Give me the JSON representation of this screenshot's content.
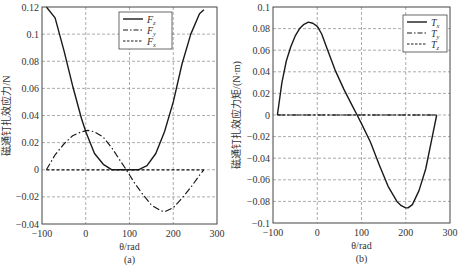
{
  "chart_data": [
    {
      "type": "line",
      "panel_label": "(a)",
      "xlabel": "θ/rad",
      "ylabel": "磁通钉扎效应力/N",
      "xlim": [
        -100,
        300
      ],
      "ylim": [
        -0.04,
        0.12
      ],
      "xticks": [
        "−100",
        "0",
        "100",
        "200",
        "300"
      ],
      "yticks": [
        "0.12",
        "0.1",
        "0.08",
        "0.06",
        "0.04",
        "0.02",
        "0",
        "−0.02",
        "−0.04"
      ],
      "grid": true,
      "legend_position": "upper right",
      "series": [
        {
          "name": "Fz",
          "style": "solid",
          "x": [
            -90,
            -70,
            -50,
            -30,
            -10,
            0,
            20,
            40,
            60,
            80,
            100,
            120,
            140,
            160,
            180,
            200,
            220,
            240,
            260,
            270
          ],
          "y": [
            0.12,
            0.112,
            0.088,
            0.062,
            0.038,
            0.028,
            0.012,
            0.004,
            0.0,
            0.0,
            0.0,
            0.0,
            0.003,
            0.012,
            0.028,
            0.05,
            0.078,
            0.1,
            0.115,
            0.118
          ]
        },
        {
          "name": "Fy",
          "style": "dashdot",
          "x": [
            -90,
            -70,
            -50,
            -30,
            -10,
            5,
            20,
            40,
            60,
            80,
            93,
            110,
            130,
            150,
            170,
            180,
            200,
            220,
            240,
            260,
            270
          ],
          "y": [
            0.0,
            0.011,
            0.019,
            0.025,
            0.028,
            0.029,
            0.028,
            0.024,
            0.016,
            0.006,
            0.0,
            -0.009,
            -0.018,
            -0.026,
            -0.03,
            -0.031,
            -0.028,
            -0.021,
            -0.013,
            -0.004,
            0.0
          ]
        },
        {
          "name": "Fx",
          "style": "dashed",
          "x": [
            -90,
            270
          ],
          "y": [
            0.0,
            0.0
          ]
        }
      ]
    },
    {
      "type": "line",
      "panel_label": "(b)",
      "xlabel": "θ/rad",
      "ylabel": "磁通钉扎效应力矩/(N·m)",
      "xlim": [
        -100,
        300
      ],
      "ylim": [
        -0.1,
        0.1
      ],
      "xticks": [
        "−100",
        "0",
        "100",
        "200",
        "300"
      ],
      "yticks": [
        "0.1",
        "0.08",
        "0.06",
        "0.04",
        "0.02",
        "0",
        "−0.02",
        "−0.04",
        "−0.06",
        "−0.08",
        "−0.1"
      ],
      "grid": true,
      "legend_position": "upper right",
      "series": [
        {
          "name": "Tx",
          "style": "solid",
          "x": [
            -90,
            -80,
            -70,
            -60,
            -50,
            -40,
            -30,
            -20,
            -10,
            0,
            10,
            20,
            40,
            60,
            80,
            90,
            100,
            120,
            140,
            160,
            180,
            190,
            200,
            205,
            215,
            230,
            245,
            260,
            270
          ],
          "y": [
            0.0,
            0.03,
            0.05,
            0.063,
            0.073,
            0.08,
            0.084,
            0.086,
            0.085,
            0.082,
            0.075,
            0.064,
            0.042,
            0.024,
            0.008,
            0.0,
            -0.008,
            -0.025,
            -0.046,
            -0.066,
            -0.08,
            -0.084,
            -0.086,
            -0.086,
            -0.083,
            -0.07,
            -0.05,
            -0.02,
            0.0
          ]
        },
        {
          "name": "Ty",
          "style": "dashdot",
          "x": [
            -90,
            270
          ],
          "y": [
            0.0,
            0.0
          ]
        },
        {
          "name": "Tz",
          "style": "dashed",
          "x": [
            -90,
            270
          ],
          "y": [
            0.0,
            0.0
          ]
        }
      ]
    }
  ],
  "panels": {
    "a": {
      "caption": "(a)",
      "xlabel": "θ/rad",
      "ylabel": "磁通钉扎效应力/N",
      "legend": [
        {
          "main": "F",
          "sub": "z"
        },
        {
          "main": "F",
          "sub": "y"
        },
        {
          "main": "F",
          "sub": "x"
        }
      ]
    },
    "b": {
      "caption": "(b)",
      "xlabel": "θ/rad",
      "ylabel": "磁通钉扎效应力矩/(N·m)",
      "legend": [
        {
          "main": "T",
          "sub": "x"
        },
        {
          "main": "T",
          "sub": "y"
        },
        {
          "main": "T",
          "sub": "z"
        }
      ]
    }
  }
}
